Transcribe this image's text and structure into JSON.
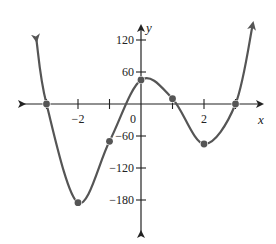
{
  "chart_data": {
    "type": "line",
    "title": "",
    "xlabel": "x",
    "ylabel": "y",
    "x_ticks": [
      -3,
      -2,
      -1,
      0,
      1,
      2,
      3
    ],
    "x_tick_labels": [
      {
        "x": -2,
        "label": "−2"
      },
      {
        "x": 0,
        "label": "0"
      },
      {
        "x": 2,
        "label": "2"
      }
    ],
    "y_ticks": [
      {
        "y": 120,
        "label": "120"
      },
      {
        "y": 60,
        "label": "60"
      },
      {
        "y": -60,
        "label": "−60"
      },
      {
        "y": -120,
        "label": "−120"
      },
      {
        "y": -180,
        "label": "−180"
      }
    ],
    "xlim": [
      -4.2,
      4.2
    ],
    "ylim": [
      -230,
      140
    ],
    "grid": false,
    "series": [
      {
        "name": "curve",
        "points": [
          {
            "x": -3,
            "y": 0
          },
          {
            "x": -2,
            "y": -185
          },
          {
            "x": -1,
            "y": -70
          },
          {
            "x": 0,
            "y": 45
          },
          {
            "x": 1,
            "y": 10
          },
          {
            "x": 2,
            "y": -75
          },
          {
            "x": 3,
            "y": 0
          }
        ]
      }
    ],
    "marked_points": [
      {
        "x": -3,
        "y": 0
      },
      {
        "x": -2,
        "y": -185
      },
      {
        "x": -1,
        "y": -70
      },
      {
        "x": 0,
        "y": 45
      },
      {
        "x": 1,
        "y": 10
      },
      {
        "x": 2,
        "y": -75
      },
      {
        "x": 3,
        "y": 0
      }
    ],
    "colors": {
      "curve": "#555555",
      "axis": "#222222",
      "dot": "#555555"
    }
  }
}
